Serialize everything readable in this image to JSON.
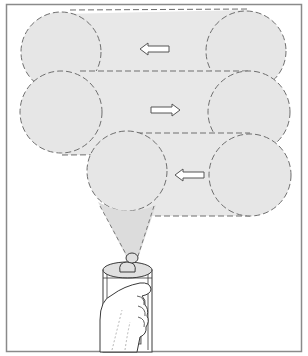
{
  "diagram": {
    "colors": {
      "frame": "#8a8a8a",
      "spray_fill": "#e6e6e6",
      "dash_stroke": "#6e6e6e",
      "arrow_stroke": "#555555",
      "line": "#3a3a3a",
      "background": "#ffffff"
    },
    "passes": [
      {
        "index": 1,
        "direction": "left",
        "arrow_icon": "left-arrow-icon"
      },
      {
        "index": 2,
        "direction": "right",
        "arrow_icon": "right-arrow-icon"
      },
      {
        "index": 3,
        "direction": "left",
        "arrow_icon": "left-arrow-icon"
      }
    ],
    "illustration": {
      "object": "spray-can-in-hand",
      "spray": "cone from nozzle to spray circle"
    }
  }
}
